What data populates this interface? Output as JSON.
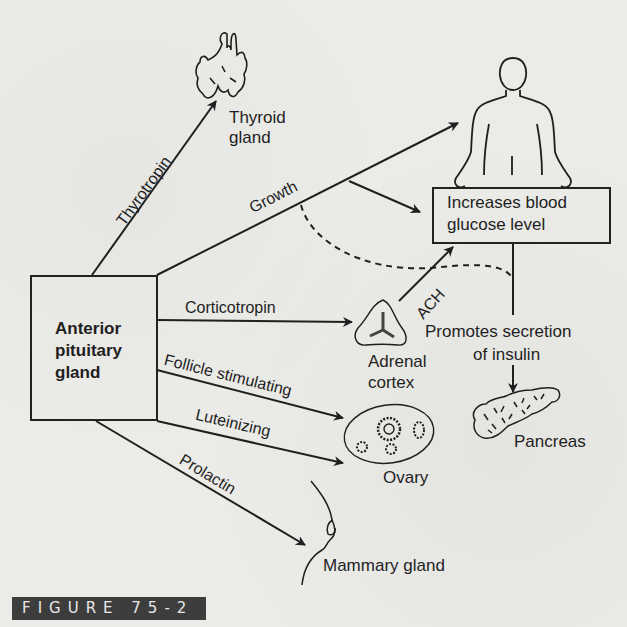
{
  "figure": {
    "label": "FIGURE 75-2"
  },
  "source": {
    "title": "Anterior pituitary gland",
    "line1": "Anterior",
    "line2": "pituitary",
    "line3": "gland"
  },
  "hormones": {
    "thyrotropin": "Thyrotropin",
    "growth": "Growth",
    "corticotropin": "Corticotropin",
    "follicle_stimulating": "Follicle stimulating",
    "luteinizing": "Luteinizing",
    "prolactin": "Prolactin",
    "ach": "ACH"
  },
  "targets": {
    "thyroid": {
      "line1": "Thyroid",
      "line2": "gland"
    },
    "adrenal": {
      "line1": "Adrenal",
      "line2": "cortex"
    },
    "ovary": "Ovary",
    "mammary": "Mammary gland",
    "pancreas": "Pancreas",
    "body": "Whole body (human figure)"
  },
  "effects": {
    "glucose_box": {
      "line1": "Increases blood",
      "line2": "glucose level"
    },
    "insulin": {
      "line1": "Promotes secretion",
      "line2": "of insulin"
    }
  },
  "colors": {
    "ink": "#1f1f1f",
    "paper": "#ebebe8",
    "badge_bg": "#3d3d3d",
    "badge_text": "#e8e8e8"
  }
}
